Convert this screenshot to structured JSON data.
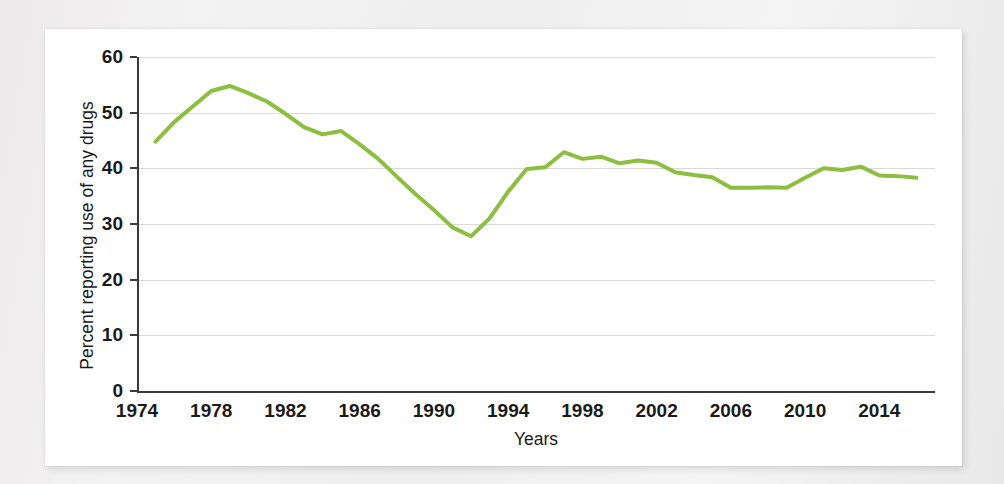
{
  "figure": {
    "background_color": "#f2f2f2",
    "panel_color": "#ffffff"
  },
  "chart_data": {
    "type": "line",
    "title": "",
    "subtitle": "",
    "xlabel": "Years",
    "ylabel": "Percent reporting use of any drugs",
    "xlim": [
      1974,
      2017
    ],
    "ylim": [
      0,
      60
    ],
    "grid": true,
    "grid_axis": "y",
    "legend": false,
    "legend_position": "none",
    "line_color": "#8cbe3f",
    "line_width": 4,
    "axis_color": "#3a3a3a",
    "gridline_color": "#d9d9d9",
    "yticks": [
      0,
      10,
      20,
      30,
      40,
      50,
      60
    ],
    "ytick_labels": [
      "0",
      "10",
      "20",
      "30",
      "40",
      "50",
      "60"
    ],
    "xticks": [
      1974,
      1978,
      1982,
      1986,
      1990,
      1994,
      1998,
      2002,
      2006,
      2010,
      2014
    ],
    "xtick_labels": [
      "1974",
      "1978",
      "1982",
      "1986",
      "1990",
      "1994",
      "1998",
      "2002",
      "2006",
      "2010",
      "2014"
    ],
    "x": [
      1975,
      1976,
      1977,
      1978,
      1979,
      1980,
      1981,
      1982,
      1983,
      1984,
      1985,
      1986,
      1987,
      1988,
      1989,
      1990,
      1991,
      1992,
      1993,
      1994,
      1995,
      1996,
      1997,
      1998,
      1999,
      2000,
      2001,
      2002,
      2003,
      2004,
      2005,
      2006,
      2007,
      2008,
      2009,
      2010,
      2011,
      2012,
      2013,
      2014,
      2015,
      2016
    ],
    "values": [
      44.8,
      48.3,
      51.1,
      53.9,
      54.8,
      53.5,
      52.0,
      49.8,
      47.4,
      46.1,
      46.7,
      44.3,
      41.7,
      38.5,
      35.4,
      32.5,
      29.4,
      27.8,
      31.0,
      35.8,
      39.9,
      40.2,
      42.9,
      41.7,
      42.1,
      40.9,
      41.4,
      41.0,
      39.3,
      38.8,
      38.4,
      36.5,
      36.5,
      36.6,
      36.5,
      38.3,
      40.0,
      39.7,
      40.3,
      38.7,
      38.6,
      38.3
    ]
  },
  "axis_titles": {
    "y": "Percent reporting use of any drugs",
    "x": "Years"
  }
}
